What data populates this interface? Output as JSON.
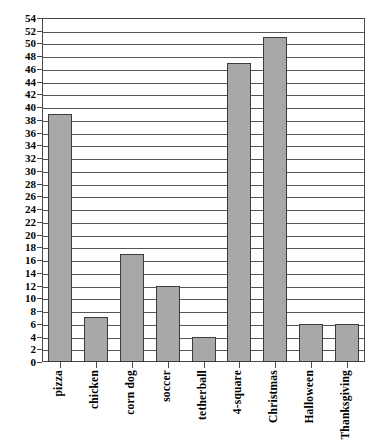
{
  "chart_data": {
    "type": "bar",
    "title": "",
    "subtitle": "",
    "xlabel": "",
    "ylabel": "",
    "categories": [
      "pizza",
      "chicken",
      "corn dog",
      "soccer",
      "tetherball",
      "4-square",
      "Christmas",
      "Halloween",
      "Thanksgiving"
    ],
    "values": [
      39,
      7,
      17,
      12,
      4,
      47,
      51,
      6,
      6
    ],
    "ylim": [
      0,
      54
    ],
    "ytick_step": 2,
    "yticks": [
      0,
      2,
      4,
      6,
      8,
      10,
      12,
      14,
      16,
      18,
      20,
      22,
      24,
      26,
      28,
      30,
      32,
      34,
      36,
      38,
      40,
      42,
      44,
      46,
      48,
      50,
      52,
      54
    ],
    "ytick_labels": [
      "0",
      "2",
      "4",
      "6",
      "8",
      "10",
      "12",
      "14",
      "16",
      "18",
      "20",
      "22",
      "24",
      "26",
      "28",
      "30",
      "32",
      "34",
      "36",
      "38",
      "40",
      "42",
      "44",
      "46",
      "48",
      "50",
      "52",
      "54"
    ],
    "grid": true,
    "grid_axis": "y",
    "legend": false,
    "legend_position": "none",
    "bar_color": "#a8a8a8",
    "bar_border_color": "#3c3c3c",
    "axis_color": "#4a4a4a",
    "grid_color": "#555555",
    "background_color": "#ffffff",
    "x_label_rotation": 90
  }
}
